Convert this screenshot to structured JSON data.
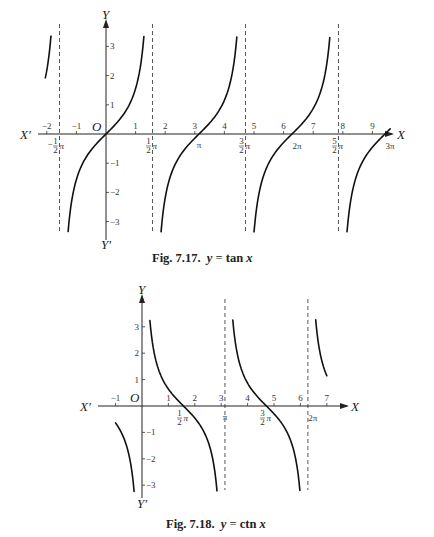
{
  "figures": [
    {
      "caption": "Fig. 7.17.  y = tan x",
      "caption_parts": {
        "prefix": "Fig. 7.17.",
        "y": "y",
        "eq": "=",
        "fn": "tan",
        "x": "x"
      },
      "axis_labels": {
        "x_pos": "X",
        "x_neg": "X′",
        "y_pos": "Y",
        "y_neg": "Y′",
        "origin": "O"
      },
      "x_ticks": [
        "−2",
        "−1",
        "1",
        "2",
        "3",
        "4",
        "5",
        "6",
        "7",
        "8",
        "9"
      ],
      "y_ticks": [
        "3",
        "2",
        "1",
        "−1",
        "−2",
        "−3"
      ],
      "pi_labels": [
        "−½π",
        "½π",
        "π",
        "3/2π",
        "2π",
        "5/2π",
        "3π"
      ]
    },
    {
      "caption": "Fig. 7.18.  y = ctn x",
      "caption_parts": {
        "prefix": "Fig. 7.18.",
        "y": "y",
        "eq": "=",
        "fn": "ctn",
        "x": "x"
      },
      "axis_labels": {
        "x_pos": "X",
        "x_neg": "X′",
        "y_pos": "Y",
        "y_neg": "Y′",
        "origin": "O"
      },
      "x_ticks": [
        "−1",
        "1",
        "2",
        "3",
        "4",
        "5",
        "6",
        "7"
      ],
      "y_ticks": [
        "3",
        "2",
        "1",
        "−1",
        "−2",
        "−3"
      ],
      "pi_labels": [
        "½π",
        "π",
        "3/2π",
        "2π"
      ]
    }
  ],
  "chart_data": [
    {
      "type": "line",
      "title": "Fig. 7.17. y = tan x",
      "function": "tan",
      "xlabel": "X",
      "ylabel": "Y",
      "xlim": [
        -2.2,
        9.8
      ],
      "ylim": [
        -3.3,
        3.3
      ],
      "x_tick_values": [
        -2,
        -1,
        1,
        2,
        3,
        4,
        5,
        6,
        7,
        8,
        9
      ],
      "y_tick_values": [
        -3,
        -2,
        -1,
        1,
        2,
        3
      ],
      "asymptotes": [
        "-π/2",
        "π/2",
        "3π/2",
        "5π/2"
      ],
      "asymptote_values": [
        -1.5708,
        1.5708,
        4.7124,
        7.854
      ],
      "zeros": [
        "0",
        "π",
        "2π",
        "3π"
      ],
      "branches": [
        {
          "x": [
            -2.05,
            -1.85
          ],
          "y": [
            2.0,
            3.3
          ]
        },
        {
          "x": [
            -1.28,
            -0.8,
            -0.4,
            0,
            0.4,
            0.8,
            1.28
          ],
          "y": [
            -3.3,
            -1.03,
            -0.42,
            0,
            0.42,
            1.03,
            3.3
          ]
        },
        {
          "x": [
            1.86,
            2.34,
            2.74,
            3.1416,
            3.54,
            3.94,
            4.42
          ],
          "y": [
            -3.3,
            -1.03,
            -0.42,
            0,
            0.42,
            1.03,
            3.3
          ]
        },
        {
          "x": [
            5.0,
            5.48,
            5.88,
            6.2832,
            6.68,
            7.08,
            7.56
          ],
          "y": [
            -3.3,
            -1.03,
            -0.42,
            0,
            0.42,
            1.03,
            3.3
          ]
        },
        {
          "x": [
            8.14,
            8.62,
            9.02,
            9.4248,
            9.6
          ],
          "y": [
            -3.3,
            -1.03,
            -0.42,
            0,
            0.18
          ]
        }
      ],
      "grid": false,
      "legend": null
    },
    {
      "type": "line",
      "title": "Fig. 7.18. y = ctn x",
      "function": "cot",
      "xlabel": "X",
      "ylabel": "Y",
      "xlim": [
        -1.5,
        7.7
      ],
      "ylim": [
        -3.4,
        3.4
      ],
      "x_tick_values": [
        -1,
        1,
        2,
        3,
        4,
        5,
        6,
        7
      ],
      "y_tick_values": [
        -3,
        -2,
        -1,
        1,
        2,
        3
      ],
      "asymptotes": [
        "0",
        "π",
        "2π"
      ],
      "asymptote_values": [
        0,
        3.1416,
        6.2832
      ],
      "zeros": [
        "π/2",
        "3π/2"
      ],
      "branches": [
        {
          "x": [
            -1.0,
            -0.6,
            -0.3
          ],
          "y": [
            -0.64,
            -1.46,
            -3.23
          ]
        },
        {
          "x": [
            0.3,
            0.6,
            1.0,
            1.5708,
            2.14,
            2.54,
            2.84
          ],
          "y": [
            3.23,
            1.46,
            0.64,
            0,
            -0.64,
            -1.46,
            -3.23
          ]
        },
        {
          "x": [
            3.44,
            3.74,
            4.14,
            4.7124,
            5.28,
            5.68,
            5.98
          ],
          "y": [
            3.23,
            1.46,
            0.64,
            0,
            -0.64,
            -1.46,
            -3.23
          ]
        },
        {
          "x": [
            6.58,
            6.88,
            7.0
          ],
          "y": [
            3.23,
            1.46,
            1.16
          ]
        }
      ],
      "grid": false,
      "legend": null
    }
  ]
}
